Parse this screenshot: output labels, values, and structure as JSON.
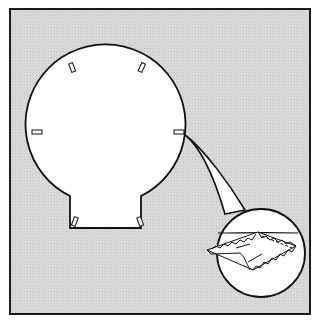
{
  "diagram": {
    "type": "technical-illustration",
    "colors": {
      "page": "#ffffff",
      "panel_fill": "#d8d8d8",
      "panel_border": "#1a1a1a",
      "shape_fill": "#ffffff",
      "line": "#111111"
    },
    "frame": {
      "x": 10,
      "y": 9,
      "w": 300,
      "h": 305
    },
    "main_shape": {
      "circle": {
        "cx": 106,
        "cy": 131,
        "r": 80
      },
      "neck": {
        "left_x": 70,
        "right_x": 141,
        "top_y": 196,
        "bottom_y": 228
      },
      "notch_count": 6
    },
    "detail_inset": {
      "cx": 260,
      "cy": 252,
      "r": 44,
      "label": "magnified edge detail"
    }
  }
}
